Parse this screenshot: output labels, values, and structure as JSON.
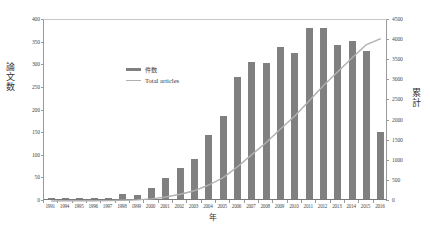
{
  "chart_data": {
    "type": "bar",
    "title": "",
    "xlabel": "年",
    "ylabel": "論文数",
    "ylabel_right": "累計",
    "ylim": [
      0,
      400
    ],
    "ylim_right": [
      0,
      4500
    ],
    "ytick_step": 50,
    "ytick_step_right": 500,
    "grid": false,
    "legend_position": "upper-left-inside",
    "categories": [
      "1991",
      "1994",
      "1995",
      "1996",
      "1997",
      "1998",
      "1999",
      "2000",
      "2001",
      "2002",
      "2003",
      "2004",
      "2005",
      "2006",
      "2007",
      "2008",
      "2009",
      "2010",
      "2011",
      "2012",
      "2013",
      "2014",
      "2015",
      "2016"
    ],
    "yticks": [
      "0",
      "50",
      "100",
      "150",
      "200",
      "250",
      "300",
      "350",
      "400"
    ],
    "yticks_right": [
      "0",
      "500",
      "1000",
      "1500",
      "2000",
      "2500",
      "3000",
      "3500",
      "4000",
      "4500"
    ],
    "series": [
      {
        "name": "件数",
        "type": "bar",
        "axis": "left",
        "color": "#808080",
        "values": [
          1,
          1,
          1,
          2,
          2,
          10,
          8,
          25,
          47,
          69,
          88,
          142,
          183,
          270,
          303,
          300,
          337,
          323,
          378,
          378,
          341,
          350,
          327,
          148
        ]
      },
      {
        "name": "Total articles",
        "type": "line",
        "axis": "right",
        "color": "#b0b0b0",
        "values": [
          1,
          4,
          5,
          7,
          9,
          19,
          27,
          52,
          99,
          168,
          256,
          398,
          581,
          851,
          1154,
          1454,
          1791,
          2114,
          2492,
          2870,
          3211,
          3561,
          3888,
          4036
        ]
      }
    ],
    "legend": [
      {
        "label": "件数",
        "marker": "bar",
        "color": "#808080"
      },
      {
        "label": "Total articles",
        "marker": "line",
        "color": "#b0b0b0"
      }
    ]
  }
}
